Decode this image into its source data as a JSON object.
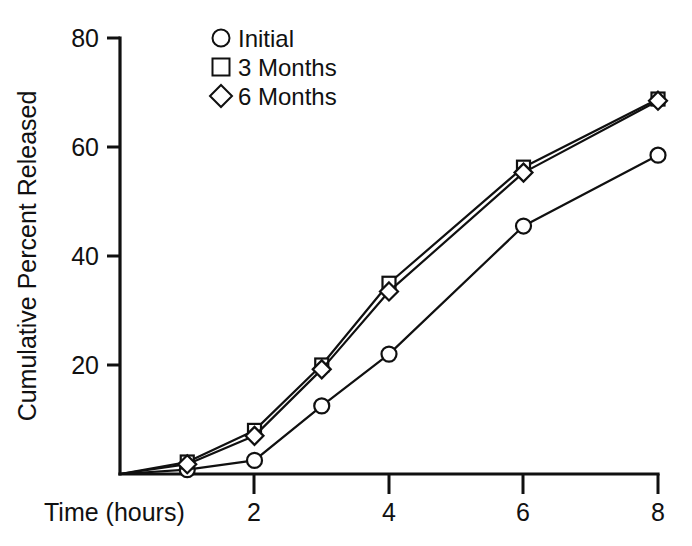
{
  "chart_data": {
    "type": "line",
    "title": "",
    "subtitle": "",
    "xlabel": "Time (hours)",
    "ylabel": "Cumulative Percent Released",
    "xlim": [
      0,
      8
    ],
    "ylim": [
      0,
      80
    ],
    "xticks": [
      2,
      4,
      6,
      8
    ],
    "xtick_labels": [
      "2",
      "4",
      "6",
      "8"
    ],
    "yticks": [
      20,
      40,
      60,
      80
    ],
    "ytick_labels": [
      "20",
      "40",
      "60",
      "80"
    ],
    "grid": false,
    "legend_position": "top-center",
    "x": [
      0,
      1,
      2,
      3,
      4,
      6,
      8
    ],
    "series": [
      {
        "name": "Initial",
        "marker": "circle",
        "values": [
          0,
          0.8,
          2.5,
          12.5,
          22.0,
          45.5,
          58.5
        ]
      },
      {
        "name": "3 Months",
        "marker": "square",
        "values": [
          0,
          2.2,
          8.0,
          20.0,
          35.0,
          56.3,
          68.8
        ]
      },
      {
        "name": "6 Months",
        "marker": "diamond",
        "values": [
          0,
          1.8,
          7.0,
          19.2,
          33.5,
          55.3,
          68.5
        ]
      }
    ]
  },
  "legend": {
    "items": [
      {
        "label": "Initial",
        "marker": "circle"
      },
      {
        "label": "3 Months",
        "marker": "square"
      },
      {
        "label": "6 Months",
        "marker": "diamond"
      }
    ]
  },
  "axes": {
    "x_title": "Time (hours)",
    "y_title": "Cumulative Percent Released"
  }
}
